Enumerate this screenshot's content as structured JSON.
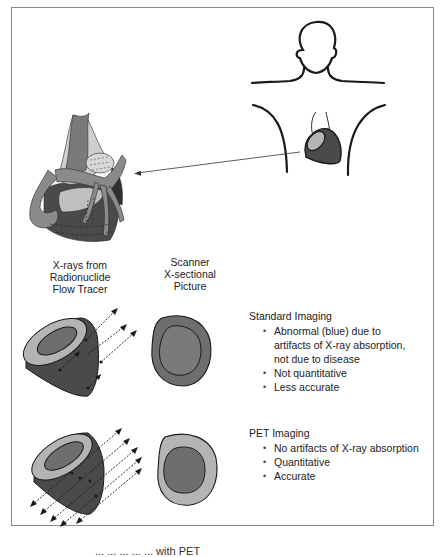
{
  "figure": {
    "type": "medical-diagram"
  },
  "columns": {
    "left_header": [
      "X-rays from",
      "Radionuclide",
      "Flow Tracer"
    ],
    "right_header": [
      "Scanner",
      "X-sectional",
      "Picture"
    ]
  },
  "standard_imaging": {
    "title": "Standard Imaging",
    "bullets": [
      [
        "Abnormal (blue) due to",
        "artifacts of X-ray absorption,",
        "not due to disease"
      ],
      [
        "Not quantitative"
      ],
      [
        "Less accurate"
      ]
    ]
  },
  "pet_imaging": {
    "title": "PET Imaging",
    "bullets": [
      [
        "No artifacts of X-ray absorption"
      ],
      [
        "Quantitative"
      ],
      [
        "Accurate"
      ]
    ]
  },
  "caption": {
    "text": "...  ...  ...  ...  ...  with PET",
    "truncated": true
  },
  "colors": {
    "frame": "#8a8a8a",
    "outline": "#1a1a1a",
    "dark_tissue": "#4a4a4a",
    "mid_tissue": "#6e6e6e",
    "light_tissue": "#b4b4b4",
    "pale_tissue": "#cfcfcf"
  }
}
